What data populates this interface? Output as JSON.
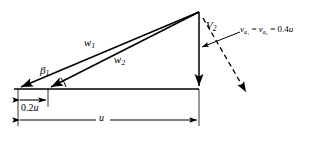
{
  "figure": {
    "type": "velocity-triangle-diagram",
    "stroke_color": "#000000",
    "background_color": "#ffffff"
  },
  "labels": {
    "w1": {
      "symbol": "w",
      "subscript": "1"
    },
    "w2": {
      "symbol": "w",
      "subscript": "2"
    },
    "beta1": {
      "symbol": "β",
      "subscript": "1"
    },
    "v2": {
      "symbol": "V",
      "subscript": "2"
    },
    "axial_velocity": {
      "term1_symbol": "v",
      "term1_subscript": "a₁",
      "equals1": "=",
      "term2_symbol": "v",
      "term2_subscript": "a₂",
      "equals2": "=",
      "value": "0.4",
      "unit_symbol": "u",
      "full_text": "va1 = va2 = 0.4u"
    }
  },
  "dimensions": [
    {
      "name": "inlet-offset",
      "value": "0.2",
      "unit_symbol": "u",
      "full_text": "0.2u"
    },
    {
      "name": "blade-speed",
      "value": "",
      "unit_symbol": "u",
      "full_text": "u"
    }
  ],
  "geometry": {
    "apex": {
      "x": 199,
      "y": 12
    },
    "baseline_y": 89,
    "w1_tail_x": 18,
    "w2_tail_x": 48,
    "dim_02u": {
      "x1": 18,
      "x2": 48,
      "y": 100
    },
    "dim_u": {
      "x1": 18,
      "x2": 199,
      "y": 120
    }
  }
}
